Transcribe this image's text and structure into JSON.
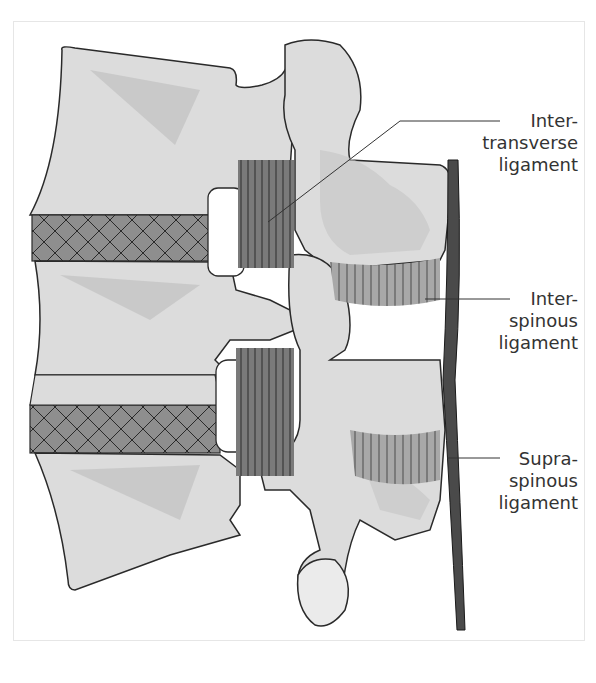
{
  "figure": {
    "labels": [
      {
        "id": "intertransverse",
        "lines": [
          "Inter-",
          "transverse",
          "ligament"
        ]
      },
      {
        "id": "interspinous",
        "lines": [
          "Inter-",
          "spinous",
          "ligament"
        ]
      },
      {
        "id": "supraspinous",
        "lines": [
          "Supra-",
          "spinous",
          "ligament"
        ]
      }
    ],
    "colors": {
      "bone": "#dcdcdc",
      "bone_shadow": "#bdbdbd",
      "ligament": "#7d7d7d",
      "supraspinous": "#4a4a4a",
      "outline": "#2a2a2a",
      "disc": "#8e8e8e"
    }
  }
}
